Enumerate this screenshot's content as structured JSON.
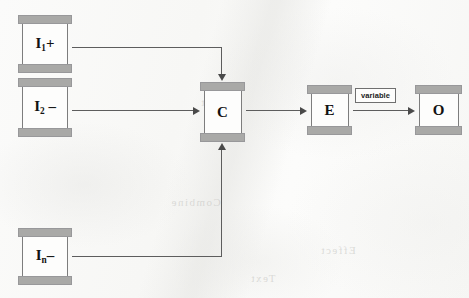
{
  "diagram": {
    "background_color": "#fafaf9",
    "module_cap_color": "#a9a9a7",
    "module_body_color": "#fdfdfc",
    "connector_color": "#5d5d5d",
    "nodes": [
      {
        "id": "i1",
        "label_main": "I",
        "label_sub": "1",
        "label_suffix": "+",
        "x": 18,
        "y": 15,
        "width": 54,
        "height": 58,
        "body_inset": 4
      },
      {
        "id": "i2",
        "label_main": "I",
        "label_sub": "2",
        "label_suffix": " –",
        "x": 18,
        "y": 78,
        "width": 54,
        "height": 59,
        "body_inset": 4
      },
      {
        "id": "in",
        "label_main": "I",
        "label_sub": "n",
        "label_suffix": "–",
        "x": 18,
        "y": 228,
        "width": 54,
        "height": 57,
        "body_inset": 4
      },
      {
        "id": "c",
        "label_main": "C",
        "label_sub": "",
        "label_suffix": "",
        "x": 200,
        "y": 82,
        "width": 45,
        "height": 60,
        "body_inset": 4
      },
      {
        "id": "e",
        "label_main": "E",
        "label_sub": "",
        "label_suffix": "",
        "x": 307,
        "y": 85,
        "width": 45,
        "height": 50,
        "body_inset": 4
      },
      {
        "id": "o",
        "label_main": "O",
        "label_sub": "",
        "label_suffix": "",
        "x": 415,
        "y": 85,
        "width": 47,
        "height": 50,
        "body_inset": 4
      }
    ],
    "edges": [
      {
        "id": "i1-to-c",
        "from": "i1",
        "to": "c",
        "label": "",
        "route": "right-then-down"
      },
      {
        "id": "i2-to-c",
        "from": "i2",
        "to": "c",
        "label": "",
        "route": "straight-right"
      },
      {
        "id": "in-to-c",
        "from": "in",
        "to": "c",
        "label": "",
        "route": "right-then-up"
      },
      {
        "id": "c-to-e",
        "from": "c",
        "to": "e",
        "label": "",
        "route": "straight-right"
      },
      {
        "id": "e-to-o",
        "from": "e",
        "to": "o",
        "label": "variable",
        "route": "straight-right"
      }
    ],
    "edge_labels": {
      "variable": "variable"
    },
    "ghost_text": [
      {
        "text": "Input",
        "x": 200,
        "y": 96
      },
      {
        "text": "Combine",
        "x": 170,
        "y": 196
      },
      {
        "text": "Text",
        "x": 250,
        "y": 272
      },
      {
        "text": "Effect",
        "x": 320,
        "y": 244
      }
    ]
  }
}
